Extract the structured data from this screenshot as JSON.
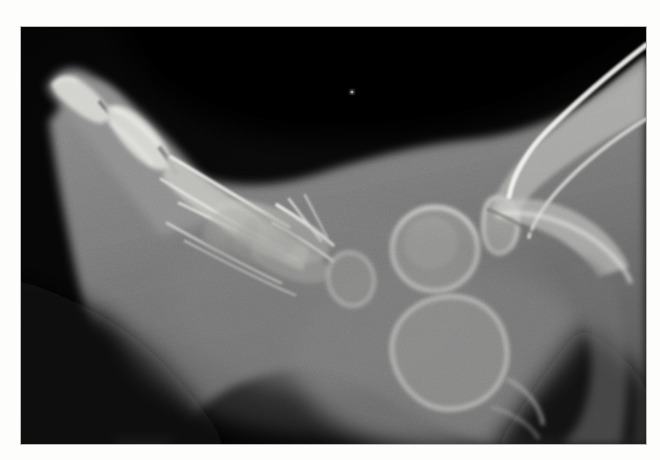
{
  "document": {
    "kind": "radiograph-figure",
    "modality": "X-ray",
    "page_background": "#fdfdfc"
  },
  "radiograph": {
    "name": "pediatric-foot-lateral-radiograph",
    "view": "lateral",
    "body_part": "foot and ankle",
    "frame": {
      "x": 21,
      "y": 27,
      "width": 625,
      "height": 417
    },
    "film_background": "#050505",
    "soft_tissue_color": "#7c7c7c",
    "bone_color": "#d9d9d9",
    "cortex_color": "#f1f1ee",
    "grain_opacity": 0.16,
    "artifact_speck": {
      "x": 352,
      "y": 92,
      "color": "#c9c9c9"
    },
    "anatomy": [
      {
        "name": "distal-phalanx-great-toe",
        "label": "distal phalanx"
      },
      {
        "name": "proximal-phalanx-great-toe",
        "label": "proximal phalanx"
      },
      {
        "name": "metatarsals",
        "label": "metatarsal shafts"
      },
      {
        "name": "cuneiforms",
        "label": "cuneiform ossification centers"
      },
      {
        "name": "cuboid",
        "label": "cuboid ossification center"
      },
      {
        "name": "navicular",
        "label": "navicular ossification center"
      },
      {
        "name": "talus",
        "label": "talar ossification center"
      },
      {
        "name": "calcaneus",
        "label": "calcaneal ossification center"
      },
      {
        "name": "distal-tibia",
        "label": "distal tibia"
      },
      {
        "name": "distal-fibula",
        "label": "distal fibula"
      },
      {
        "name": "heel-soft-tissue",
        "label": "heel soft tissue pad"
      }
    ]
  }
}
